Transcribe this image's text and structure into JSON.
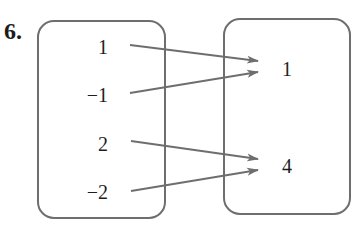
{
  "problem_number": "6.",
  "diagram": {
    "type": "mapping",
    "domain": [
      "1",
      "−1",
      "2",
      "−2"
    ],
    "range": [
      "1",
      "4"
    ],
    "mappings": [
      {
        "from": "1",
        "to": "1"
      },
      {
        "from": "−1",
        "to": "1"
      },
      {
        "from": "2",
        "to": "4"
      },
      {
        "from": "−2",
        "to": "4"
      }
    ]
  },
  "colors": {
    "box_stroke": "#6e6e6e",
    "arrow": "#6e6e6e",
    "text": "#1e1e1e"
  }
}
